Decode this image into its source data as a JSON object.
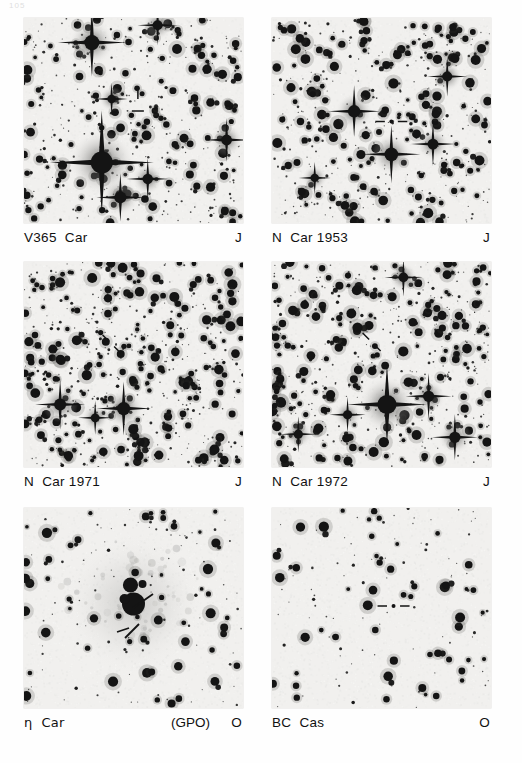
{
  "figure": {
    "page_number": "105",
    "type": "photographic-plate-grid",
    "rows": 3,
    "columns": 2,
    "background_tone": "#f1f0ee",
    "star_color": "#141414"
  },
  "panels": [
    {
      "id": "v365-car",
      "object_label": "V365  Car",
      "annotation": "",
      "plate_letter": "J",
      "marker": "cross-ticks",
      "marker_x": 0.52,
      "marker_y": 0.42,
      "position": {
        "x": 24,
        "y": 18,
        "w": 219,
        "h": 205
      },
      "caption_y": 228,
      "seed": 101,
      "star_count": 430,
      "diffraction_stars": [
        {
          "x": 0.31,
          "y": 0.12,
          "r": 7.5,
          "spike": 34
        },
        {
          "x": 0.61,
          "y": 0.035,
          "r": 5.0,
          "spike": 20
        },
        {
          "x": 0.4,
          "y": 0.395,
          "r": 4.2,
          "spike": 16
        },
        {
          "x": 0.355,
          "y": 0.705,
          "r": 11.0,
          "spike": 52
        },
        {
          "x": 0.44,
          "y": 0.875,
          "r": 6.0,
          "spike": 24
        },
        {
          "x": 0.565,
          "y": 0.785,
          "r": 5.2,
          "spike": 21
        },
        {
          "x": 0.925,
          "y": 0.595,
          "r": 5.4,
          "spike": 22
        }
      ]
    },
    {
      "id": "n-car-1953",
      "object_label": "N  Car 1953",
      "annotation": "",
      "plate_letter": "J",
      "marker": "horizontal-ticks",
      "marker_x": 0.545,
      "marker_y": 0.505,
      "position": {
        "x": 272,
        "y": 18,
        "w": 219,
        "h": 205
      },
      "caption_y": 228,
      "seed": 202,
      "star_count": 470,
      "diffraction_stars": [
        {
          "x": 0.375,
          "y": 0.455,
          "r": 6.2,
          "spike": 26
        },
        {
          "x": 0.545,
          "y": 0.665,
          "r": 6.8,
          "spike": 29
        },
        {
          "x": 0.735,
          "y": 0.615,
          "r": 5.4,
          "spike": 22
        },
        {
          "x": 0.8,
          "y": 0.285,
          "r": 5.0,
          "spike": 20
        },
        {
          "x": 0.195,
          "y": 0.78,
          "r": 4.2,
          "spike": 16
        }
      ]
    },
    {
      "id": "n-car-1971",
      "object_label": "N  Car 1971",
      "annotation": "",
      "plate_letter": "J",
      "marker": "diagonal-ticks",
      "marker_x": 0.4,
      "marker_y": 0.4,
      "position": {
        "x": 24,
        "y": 262,
        "w": 219,
        "h": 205
      },
      "caption_y": 472,
      "seed": 303,
      "star_count": 560,
      "diffraction_stars": [
        {
          "x": 0.165,
          "y": 0.695,
          "r": 6.0,
          "spike": 25
        },
        {
          "x": 0.455,
          "y": 0.715,
          "r": 6.6,
          "spike": 27
        },
        {
          "x": 0.325,
          "y": 0.76,
          "r": 4.4,
          "spike": 17
        }
      ]
    },
    {
      "id": "n-car-1972",
      "object_label": "N  Car 1972",
      "annotation": "",
      "plate_letter": "J",
      "marker": "diagonal-ticks",
      "marker_x": 0.455,
      "marker_y": 0.39,
      "position": {
        "x": 272,
        "y": 262,
        "w": 219,
        "h": 205
      },
      "caption_y": 472,
      "seed": 404,
      "star_count": 540,
      "diffraction_stars": [
        {
          "x": 0.525,
          "y": 0.695,
          "r": 9.5,
          "spike": 40
        },
        {
          "x": 0.715,
          "y": 0.655,
          "r": 5.6,
          "spike": 23
        },
        {
          "x": 0.345,
          "y": 0.745,
          "r": 4.6,
          "spike": 18
        },
        {
          "x": 0.835,
          "y": 0.855,
          "r": 5.6,
          "spike": 23
        },
        {
          "x": 0.6,
          "y": 0.075,
          "r": 4.8,
          "spike": 19
        },
        {
          "x": 0.12,
          "y": 0.84,
          "r": 4.6,
          "spike": 18
        }
      ]
    },
    {
      "id": "eta-car",
      "object_label": "η  Car",
      "annotation": "(GPO)",
      "plate_letter": "O",
      "marker": "double-diagonal-ticks",
      "marker_x": 0.58,
      "marker_y": 0.47,
      "position": {
        "x": 24,
        "y": 508,
        "w": 219,
        "h": 200
      },
      "caption_y": 714,
      "seed": 505,
      "star_count": 150,
      "diffraction_stars": [],
      "nebula": {
        "x": 0.5,
        "y": 0.48,
        "r": 22
      }
    },
    {
      "id": "bc-cas",
      "object_label": "BC  Cas",
      "annotation": "",
      "plate_letter": "O",
      "marker": "horizontal-ticks",
      "marker_x": 0.555,
      "marker_y": 0.49,
      "position": {
        "x": 272,
        "y": 508,
        "w": 219,
        "h": 200
      },
      "caption_y": 714,
      "seed": 606,
      "star_count": 135,
      "diffraction_stars": []
    }
  ]
}
